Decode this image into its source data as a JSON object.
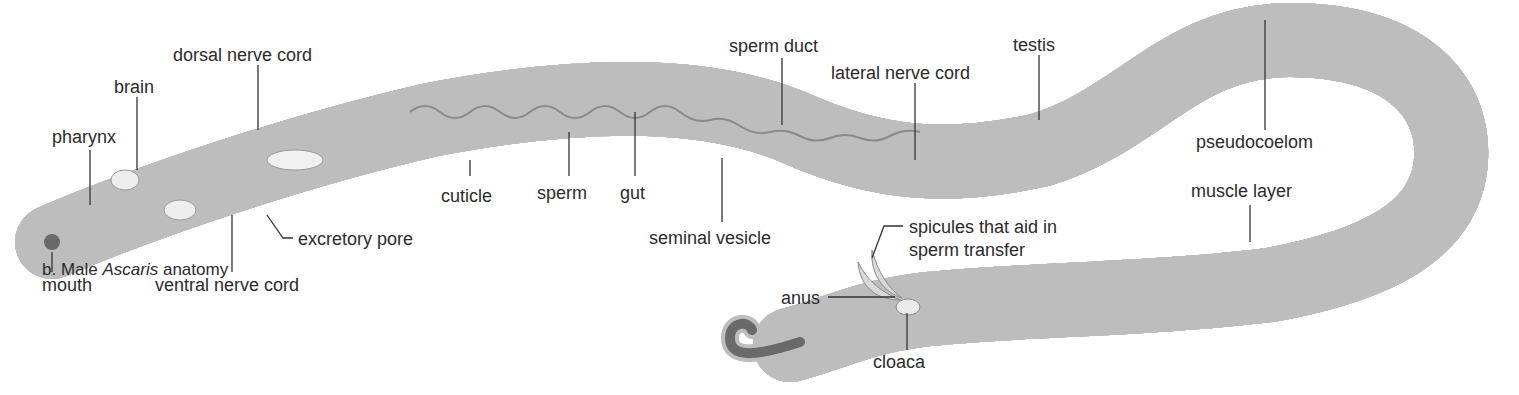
{
  "figure": {
    "caption_prefix": "b. Male ",
    "caption_italic": "Ascaris",
    "caption_suffix": " anatomy",
    "colors": {
      "cuticle": "#bdbdbd",
      "body_dark": "#5a5a5a",
      "body_mid": "#8c8c8c",
      "body_light": "#d9d9d9",
      "highlight": "#f4f4f4",
      "label_text": "#2b2b2b",
      "leader_line": "#333333",
      "background": "#ffffff"
    }
  },
  "labels": {
    "dorsal_nerve_cord": "dorsal nerve cord",
    "brain": "brain",
    "pharynx": "pharynx",
    "mouth": "mouth",
    "ventral_nerve_cord": "ventral nerve cord",
    "excretory_pore": "excretory pore",
    "cuticle": "cuticle",
    "sperm": "sperm",
    "gut": "gut",
    "seminal_vesicle": "seminal vesicle",
    "sperm_duct": "sperm duct",
    "lateral_nerve_cord": "lateral nerve cord",
    "testis": "testis",
    "pseudocoelom": "pseudocoelom",
    "muscle_layer": "muscle layer",
    "spicules": "spicules that aid in sperm transfer",
    "anus": "anus",
    "cloaca": "cloaca"
  }
}
